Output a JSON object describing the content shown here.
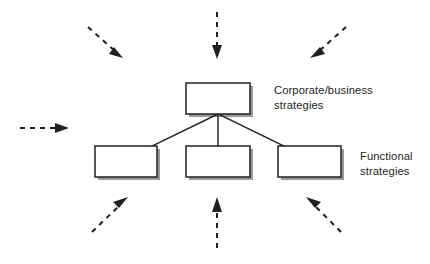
{
  "diagram": {
    "type": "hierarchy-diagram",
    "colors": {
      "background": "#ffffff",
      "box_fill": "#ffffff",
      "box_border": "#231f20",
      "box_shadow": "#9a9a9a",
      "connector": "#231f20",
      "arrow": "#231f20",
      "text": "#231f20"
    },
    "labels": {
      "corporate": "Corporate/business\nstrategies",
      "functional": "Functional\nstrategies"
    },
    "boxes": [
      {
        "id": "corporate-box",
        "name": "corporate-business-strategy-box",
        "x": 186,
        "y": 83,
        "w": 64,
        "h": 31,
        "label": ""
      },
      {
        "id": "functional-box-left",
        "name": "functional-strategy-box-left",
        "x": 95,
        "y": 146,
        "w": 62,
        "h": 31,
        "label": ""
      },
      {
        "id": "functional-box-center",
        "name": "functional-strategy-box-center",
        "x": 186,
        "y": 146,
        "w": 64,
        "h": 31,
        "label": ""
      },
      {
        "id": "functional-box-right",
        "name": "functional-strategy-box-right",
        "x": 278,
        "y": 146,
        "w": 63,
        "h": 31,
        "label": ""
      }
    ],
    "connectors": [
      {
        "id": "connector-left",
        "from": "corporate-box",
        "to": "functional-box-left",
        "x1": 218,
        "y1": 114,
        "x2": 152,
        "y2": 146
      },
      {
        "id": "connector-center",
        "from": "corporate-box",
        "to": "functional-box-center",
        "x1": 218,
        "y1": 114,
        "x2": 218,
        "y2": 146
      },
      {
        "id": "connector-right",
        "from": "corporate-box",
        "to": "functional-box-right",
        "x1": 218,
        "y1": 114,
        "x2": 284,
        "y2": 146
      }
    ],
    "arrows": [
      {
        "id": "arrow-top-left",
        "name": "influence-arrow-top-left",
        "direction": "down-right",
        "x1": 88,
        "y1": 27,
        "x2": 120,
        "y2": 56
      },
      {
        "id": "arrow-top-center",
        "name": "influence-arrow-top-center",
        "direction": "down",
        "x1": 217,
        "y1": 12,
        "x2": 217,
        "y2": 56
      },
      {
        "id": "arrow-top-right",
        "name": "influence-arrow-top-right",
        "direction": "down-left",
        "x1": 346,
        "y1": 27,
        "x2": 313,
        "y2": 56
      },
      {
        "id": "arrow-left",
        "name": "influence-arrow-left",
        "direction": "right",
        "x1": 20,
        "y1": 128,
        "x2": 66,
        "y2": 128
      },
      {
        "id": "arrow-bottom-left",
        "name": "influence-arrow-bottom-left",
        "direction": "up-right",
        "x1": 92,
        "y1": 232,
        "x2": 125,
        "y2": 199
      },
      {
        "id": "arrow-bottom-center",
        "name": "influence-arrow-bottom-center",
        "direction": "up",
        "x1": 217,
        "y1": 248,
        "x2": 217,
        "y2": 200
      },
      {
        "id": "arrow-bottom-right",
        "name": "influence-arrow-bottom-right",
        "direction": "up-left",
        "x1": 341,
        "y1": 232,
        "x2": 309,
        "y2": 199
      }
    ]
  }
}
